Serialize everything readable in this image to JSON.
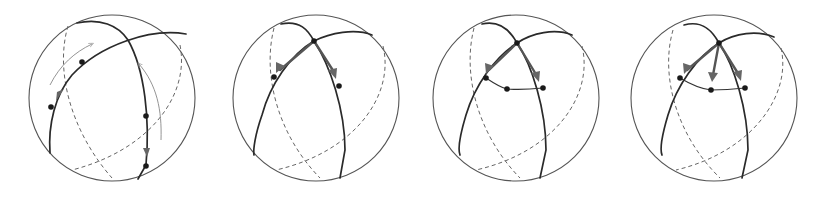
{
  "figure": {
    "panels": [
      {
        "id": "panel-1",
        "label": "Sphere with two great circles and motion arrows along arcs",
        "points": 4,
        "arrows": 2,
        "motion_arrows": 2
      },
      {
        "id": "panel-2",
        "label": "Sphere with two tangent vectors at intersection point",
        "points": 3,
        "arrows": 2
      },
      {
        "id": "panel-3",
        "label": "Sphere with geodesic triangle and midpoint",
        "points": 4,
        "arrows": 2
      },
      {
        "id": "panel-4",
        "label": "Sphere with three tangent vectors from vertex",
        "points": 4,
        "arrows": 3
      }
    ],
    "colors": {
      "outline": "#555555",
      "front_arc": "#2a2a2a",
      "back_arc": "#666666",
      "vector": "#555555",
      "point": "#1a1a1a",
      "background": "#ffffff"
    }
  }
}
